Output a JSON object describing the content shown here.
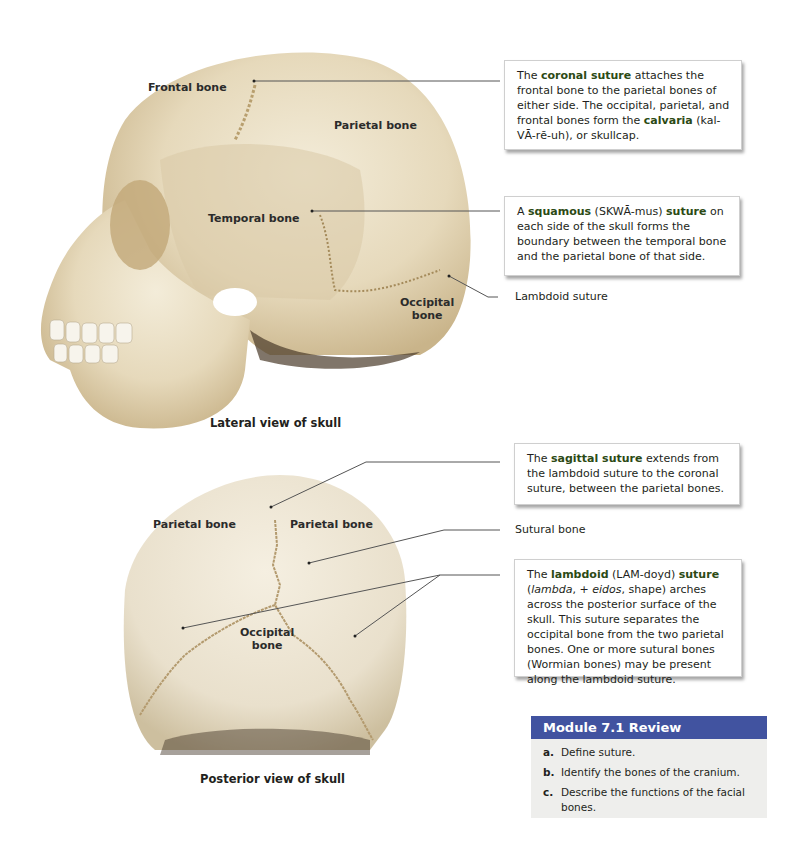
{
  "lateral_view": {
    "caption": "Lateral view of skull",
    "labels": {
      "frontal": "Frontal bone",
      "parietal": "Parietal bone",
      "temporal": "Temporal bone",
      "occipital_line1": "Occipital",
      "occipital_line2": "bone"
    }
  },
  "posterior_view": {
    "caption": "Posterior view of skull",
    "labels": {
      "parietal_left": "Parietal bone",
      "parietal_right": "Parietal bone",
      "occipital_line1": "Occipital",
      "occipital_line2": "bone"
    }
  },
  "callouts": {
    "coronal": {
      "p1": "The ",
      "term1": "coronal suture",
      "p2": " attaches the frontal bone to the parietal bones of either side. The occipital, parietal, and frontal bones form the ",
      "term2": "calvaria",
      "p3": " (kal-VĀ-rē-uh), or skullcap."
    },
    "squamous": {
      "p1": "A ",
      "term1": "squamous",
      "p2": " (SKWĀ-mus) ",
      "term2": "suture",
      "p3": " on each side of the skull forms the boundary between the temporal bone and the parietal bone of that side."
    },
    "lambdoid_label": "Lambdoid suture",
    "sagittal": {
      "p1": "The ",
      "term1": "sagittal suture",
      "p2": " extends from the lambdoid suture to the coronal suture, between the parietal bones."
    },
    "sutural_label": "Sutural bone",
    "lambdoid": {
      "p1": "The ",
      "term1": "lambdoid",
      "p2": " (LAM-doyd) ",
      "term2": "suture",
      "p3": " (",
      "italic1": "lambda",
      "p4": ", + ",
      "italic2": "eidos",
      "p5": ", shape) arches across the posterior surface of the skull. This suture separates the occipital bone from the two parietal bones. One or more sutural bones (Wormian bones) may be present along the lambdoid suture."
    }
  },
  "review": {
    "title": "Module 7.1 Review",
    "items": [
      {
        "letter": "a.",
        "text": "Define suture."
      },
      {
        "letter": "b.",
        "text": "Identify the bones of the cranium."
      },
      {
        "letter": "c.",
        "text": "Describe the functions of the facial bones."
      }
    ]
  },
  "colors": {
    "review_header": "#4153a0",
    "review_bg": "#eeeeec",
    "bone": "#e8dcc0",
    "leader_line": "#555555"
  }
}
